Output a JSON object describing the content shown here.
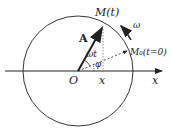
{
  "diagram": {
    "title": "",
    "labels": {
      "origin": "O",
      "point_t": "M(t)",
      "point_0": "M₀(t=0)",
      "amplitude": "A",
      "omega": "ω",
      "omega_t": "ωt",
      "phi": "φ",
      "x_proj": "x",
      "x_axis": "x"
    },
    "colors": {
      "stroke": "#222222",
      "background": "#ffffff"
    }
  }
}
